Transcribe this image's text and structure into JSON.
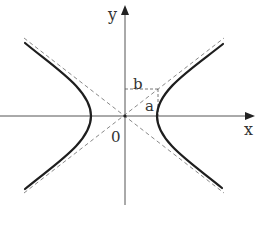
{
  "diagram": {
    "type": "hyperbola",
    "colors": {
      "background": "#ffffff",
      "axis": "#555555",
      "curve": "#222222",
      "asymptote": "#777777",
      "text": "#333333"
    },
    "axes": {
      "x_label": "x",
      "y_label": "y",
      "origin_label": "0"
    },
    "labels": {
      "rect_width": "b",
      "rect_height": "a"
    }
  }
}
